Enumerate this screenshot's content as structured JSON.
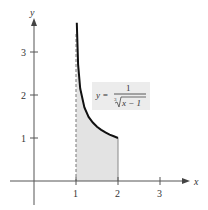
{
  "chart_data": {
    "type": "area",
    "title": "",
    "xlabel": "x",
    "ylabel": "y",
    "xlim": [
      -0.8,
      3.9
    ],
    "ylim": [
      -0.7,
      4.0
    ],
    "x_ticks": [
      1,
      2,
      3
    ],
    "y_ticks": [
      1,
      2,
      3
    ],
    "grid": false,
    "function": "y = 1 / cbrt(x - 1)",
    "annotation": {
      "text_lhs": "y =",
      "numerator": "1",
      "denominator": "∛x − 1"
    },
    "shaded_region": {
      "x_from": 1,
      "x_to": 2,
      "description": "region under curve between x = 1 and x = 2"
    },
    "curve_points": [
      {
        "x": 1.02,
        "y": 3.68
      },
      {
        "x": 1.05,
        "y": 2.71
      },
      {
        "x": 1.1,
        "y": 2.15
      },
      {
        "x": 1.2,
        "y": 1.71
      },
      {
        "x": 1.3,
        "y": 1.49
      },
      {
        "x": 1.4,
        "y": 1.36
      },
      {
        "x": 1.5,
        "y": 1.26
      },
      {
        "x": 1.6,
        "y": 1.19
      },
      {
        "x": 1.7,
        "y": 1.13
      },
      {
        "x": 1.8,
        "y": 1.08
      },
      {
        "x": 1.9,
        "y": 1.04
      },
      {
        "x": 2.0,
        "y": 1.0
      }
    ],
    "dashed_line": {
      "x": 1
    }
  },
  "labels": {
    "x_axis": "x",
    "y_axis": "y",
    "x_tick_1": "1",
    "x_tick_2": "2",
    "x_tick_3": "3",
    "y_tick_1": "1",
    "y_tick_2": "2",
    "y_tick_3": "3",
    "eq_lhs": "y =",
    "eq_num": "1",
    "eq_root": "3",
    "eq_den": "x − 1"
  }
}
